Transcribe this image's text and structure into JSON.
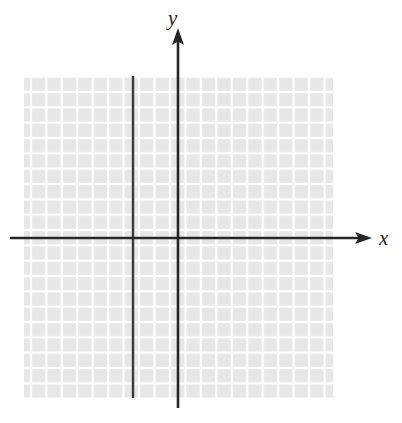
{
  "figure": {
    "type": "coordinate-plane",
    "width": 402,
    "height": 423,
    "background_color": "#ffffff",
    "axis_labels": {
      "x": "x",
      "y": "y"
    },
    "axis_color": "#262626",
    "grid": {
      "cell_color": "#e7e7e7",
      "gap_color": "#ffffff",
      "left": 24,
      "top": 76,
      "right": 333,
      "bottom": 398,
      "columns": 20,
      "rows": 21,
      "cell_size": 15.45
    },
    "axes": {
      "x_axis": {
        "y_pixel": 238,
        "x_start": 10,
        "x_end": 372,
        "arrow": "right"
      },
      "y_axis": {
        "x_pixel": 178,
        "y_start": 28,
        "y_end": 408,
        "arrow": "up"
      }
    },
    "plotted": [
      {
        "name": "vertical-line",
        "kind": "line",
        "orientation": "vertical",
        "x_pixel": 133,
        "y_top": 76,
        "y_bottom": 398,
        "x_units_from_y_axis": -3,
        "color": "#3a3a3a"
      }
    ]
  },
  "chart_data": {
    "type": "line",
    "title": "",
    "xlabel": "x",
    "ylabel": "y",
    "grid": true,
    "legend": "none",
    "xlim": [
      -10,
      10
    ],
    "ylim": [
      -11,
      10
    ],
    "series": [
      {
        "name": "vertical line",
        "equation": "x = -3",
        "x": [
          -3,
          -3
        ],
        "y": [
          -11,
          10
        ]
      }
    ],
    "annotations": []
  }
}
